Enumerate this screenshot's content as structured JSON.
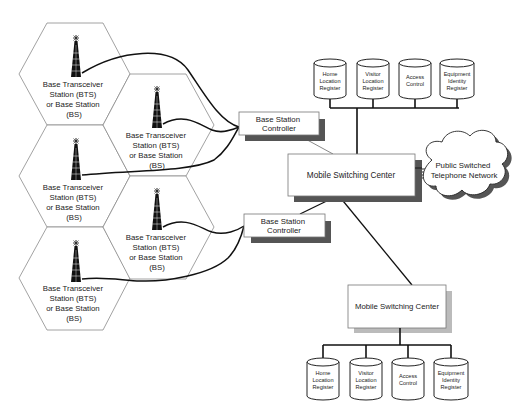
{
  "diagram": {
    "type": "GSM cellular network architecture",
    "cells": [
      {
        "id": "cell-1",
        "lines": [
          "Base Transceiver",
          "Station (BTS)",
          "or Base Station",
          "(BS)"
        ]
      },
      {
        "id": "cell-2",
        "lines": [
          "Base Transceiver",
          "Station (BTS)",
          "or Base Station",
          "(BS)"
        ]
      },
      {
        "id": "cell-3",
        "lines": [
          "Base Transceiver",
          "Station (BTS)",
          "or Base Station",
          "(BS)"
        ]
      },
      {
        "id": "cell-4",
        "lines": [
          "Base Transceiver",
          "Station (BTS)",
          "or Base Station",
          "(BS)"
        ]
      },
      {
        "id": "cell-5",
        "lines": [
          "Base Transceiver",
          "Station (BTS)",
          "or Base Station",
          "(BS)"
        ]
      }
    ],
    "bsc": [
      {
        "lines": [
          "Base Station",
          "Controller"
        ]
      },
      {
        "lines": [
          "Base Station",
          "Controller"
        ]
      }
    ],
    "msc": [
      {
        "label": "Mobile Switching Center"
      },
      {
        "label": "Mobile Switching Center"
      }
    ],
    "pstn": {
      "lines": [
        "Public Switched",
        "Telephone Network"
      ]
    },
    "registers_top": [
      {
        "lines": [
          "Home",
          "Location",
          "Register"
        ]
      },
      {
        "lines": [
          "Visitor",
          "Location",
          "Register"
        ]
      },
      {
        "lines": [
          "Access",
          "Control"
        ]
      },
      {
        "lines": [
          "Equipment",
          "Identity",
          "Register"
        ]
      }
    ],
    "registers_bottom": [
      {
        "lines": [
          "Home",
          "Location",
          "Register"
        ]
      },
      {
        "lines": [
          "Visitor",
          "Location",
          "Register"
        ]
      },
      {
        "lines": [
          "Access",
          "Control"
        ]
      },
      {
        "lines": [
          "Equipment",
          "Identity",
          "Register"
        ]
      }
    ],
    "colors": {
      "line": "#111111",
      "hex_stroke": "#8a8a8a",
      "shadow": "#5a5a5a",
      "box_stroke": "#777777",
      "text": "#222222"
    }
  }
}
